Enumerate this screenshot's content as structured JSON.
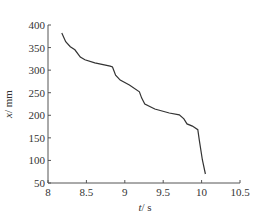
{
  "chart_data": {
    "type": "line",
    "title": "",
    "xlabel": "t / s",
    "ylabel": "x / mm",
    "xlabel_var": "t",
    "xlabel_unit": "/ s",
    "ylabel_var": "x",
    "ylabel_unit": "/ mm",
    "xlim": [
      8,
      10.5
    ],
    "ylim": [
      50,
      400
    ],
    "xticks": [
      8,
      8.5,
      9,
      9.5,
      10,
      10.5
    ],
    "xtick_labels": [
      "8",
      "8.5",
      "9",
      "9.5",
      "10",
      "10.5"
    ],
    "yticks": [
      50,
      100,
      150,
      200,
      250,
      300,
      350,
      400
    ],
    "ytick_labels": [
      "50",
      "100",
      "150",
      "200",
      "250",
      "300",
      "350",
      "400"
    ],
    "grid": false,
    "legend": null,
    "series": [
      {
        "name": "x(t)",
        "color": "#333333",
        "x": [
          8.18,
          8.23,
          8.29,
          8.35,
          8.42,
          8.48,
          8.61,
          8.81,
          8.84,
          8.88,
          8.94,
          9.06,
          9.19,
          9.22,
          9.26,
          9.39,
          9.58,
          9.71,
          9.77,
          9.81,
          9.88,
          9.95,
          9.97,
          10.01,
          10.05
        ],
        "y": [
          382,
          363,
          352,
          345,
          329,
          323,
          316,
          309,
          307,
          289,
          278,
          267,
          252,
          238,
          225,
          214,
          205,
          201,
          192,
          181,
          176,
          168,
          145,
          101,
          70
        ]
      }
    ]
  }
}
